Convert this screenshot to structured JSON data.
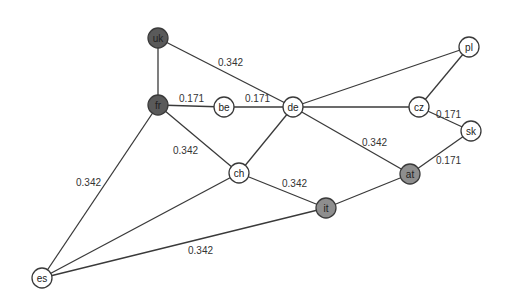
{
  "diagram": {
    "type": "network-graph",
    "node_radius": 10,
    "colors": {
      "dark": "#5a5a5a",
      "medium": "#8e8e8e",
      "light": "#ffffff",
      "edge": "#3a3a3a"
    },
    "nodes": [
      {
        "id": "uk",
        "label": "uk",
        "x": 158,
        "y": 38,
        "fill": "#5a5a5a"
      },
      {
        "id": "fr",
        "label": "fr",
        "x": 158,
        "y": 105,
        "fill": "#5a5a5a"
      },
      {
        "id": "be",
        "label": "be",
        "x": 224,
        "y": 107,
        "fill": "#ffffff"
      },
      {
        "id": "de",
        "label": "de",
        "x": 293,
        "y": 107,
        "fill": "#ffffff"
      },
      {
        "id": "pl",
        "label": "pl",
        "x": 469,
        "y": 47,
        "fill": "#ffffff"
      },
      {
        "id": "cz",
        "label": "cz",
        "x": 419,
        "y": 107,
        "fill": "#ffffff"
      },
      {
        "id": "sk",
        "label": "sk",
        "x": 471,
        "y": 131,
        "fill": "#ffffff"
      },
      {
        "id": "ch",
        "label": "ch",
        "x": 239,
        "y": 173,
        "fill": "#ffffff"
      },
      {
        "id": "at",
        "label": "at",
        "x": 410,
        "y": 174,
        "fill": "#8e8e8e"
      },
      {
        "id": "it",
        "label": "it",
        "x": 326,
        "y": 208,
        "fill": "#8e8e8e"
      },
      {
        "id": "es",
        "label": "es",
        "x": 42,
        "y": 278,
        "fill": "#ffffff"
      }
    ],
    "edges": [
      {
        "from": "uk",
        "to": "fr",
        "label": ""
      },
      {
        "from": "uk",
        "to": "de",
        "label": "0.342",
        "lx": 218,
        "ly": 66
      },
      {
        "from": "fr",
        "to": "be",
        "label": "0.171",
        "lx": 179,
        "ly": 102
      },
      {
        "from": "be",
        "to": "de",
        "label": "0.171",
        "lx": 245,
        "ly": 102
      },
      {
        "from": "fr",
        "to": "ch",
        "label": "0.342",
        "lx": 173,
        "ly": 154
      },
      {
        "from": "fr",
        "to": "es",
        "label": "0.342",
        "lx": 76,
        "ly": 186
      },
      {
        "from": "de",
        "to": "ch",
        "label": ""
      },
      {
        "from": "de",
        "to": "pl",
        "label": ""
      },
      {
        "from": "de",
        "to": "cz",
        "label": ""
      },
      {
        "from": "de",
        "to": "at",
        "label": "0.342",
        "lx": 362,
        "ly": 146
      },
      {
        "from": "pl",
        "to": "cz",
        "label": ""
      },
      {
        "from": "cz",
        "to": "sk",
        "label": "0.171",
        "lx": 436,
        "ly": 118
      },
      {
        "from": "sk",
        "to": "at",
        "label": "0.171",
        "lx": 436,
        "ly": 164
      },
      {
        "from": "ch",
        "to": "it",
        "label": "0.342",
        "lx": 282,
        "ly": 187
      },
      {
        "from": "ch",
        "to": "es",
        "label": ""
      },
      {
        "from": "at",
        "to": "it",
        "label": ""
      },
      {
        "from": "it",
        "to": "es",
        "label": "0.342",
        "lx": 188,
        "ly": 254
      }
    ]
  }
}
